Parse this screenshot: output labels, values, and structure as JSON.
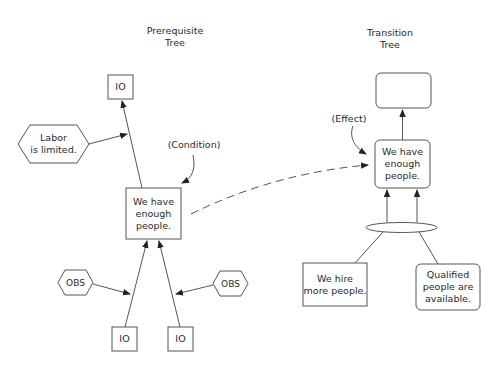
{
  "prerequisite_tree": {
    "title": "Prerequisite\nTree",
    "condition_label": "(Condition)",
    "nodes": {
      "top_io": "IO",
      "obstacle_labor": "Labor\nis limited.",
      "center": "We have\nenough\npeople.",
      "obs_left": "OBS",
      "obs_right": "OBS",
      "bottom_io_left": "IO",
      "bottom_io_right": "IO"
    }
  },
  "transition_tree": {
    "title": "Transition\nTree",
    "effect_label": "(Effect)",
    "nodes": {
      "top_empty": "",
      "effect": "We have\nenough\npeople.",
      "action": "We hire\nmore people.",
      "condition": "Qualified\npeople are\navailable."
    }
  },
  "colors": {
    "stroke": "#555555",
    "text": "#2a2a2a",
    "background": "#ffffff"
  }
}
